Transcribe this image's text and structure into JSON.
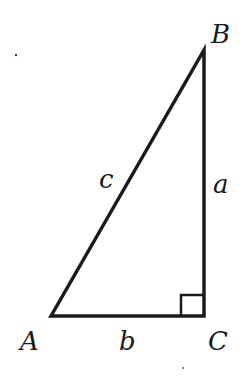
{
  "diagram": {
    "type": "right-triangle",
    "vertices": {
      "A": {
        "label": "A",
        "x": 51,
        "y": 316
      },
      "B": {
        "label": "B",
        "x": 204,
        "y": 50
      },
      "C": {
        "label": "C",
        "x": 204,
        "y": 316
      }
    },
    "sides": {
      "a": {
        "label": "a",
        "between": [
          "B",
          "C"
        ]
      },
      "b": {
        "label": "b",
        "between": [
          "A",
          "C"
        ]
      },
      "c": {
        "label": "c",
        "between": [
          "A",
          "B"
        ]
      }
    },
    "right_angle_at": "C",
    "stroke_color": "#1a1a1a",
    "background": "#ffffff"
  }
}
